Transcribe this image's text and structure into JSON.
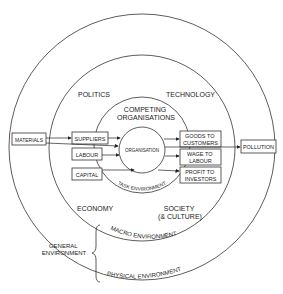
{
  "diagram": {
    "rings": {
      "general": "GENERAL\nENVIRONMENT",
      "general_lines": [
        "GENERAL",
        "ENVIRONMENT"
      ],
      "macro": "MACRO ENVIRONMENT",
      "physical": "PHYSICAL ENVIRONMENT",
      "task": "TASK ENVIRONMENT"
    },
    "macro_factors": {
      "politics": "POLITICS",
      "technology": "TECHNOLOGY",
      "economy": "ECONOMY",
      "society_lines": [
        "SOCIETY",
        "(& CULTURE)"
      ]
    },
    "competing_lines": [
      "COMPETING",
      "ORGANISATIONS"
    ],
    "centre": "ORGANISATION",
    "inputs": {
      "materials": "MATERIALS",
      "suppliers": "SUPPLIERS",
      "labour": "LABOUR",
      "capital": "CAPITAL"
    },
    "outputs": {
      "goods_lines": [
        "GOODS TO",
        "CUSTOMERS"
      ],
      "wage_lines": [
        "WAGE TO",
        "LABOUR"
      ],
      "profit_lines": [
        "PROFIT TO",
        "INVESTORS"
      ],
      "pollution": "POLLUTION"
    },
    "colors": {
      "line": "#333333",
      "text": "#222222",
      "background": "#ffffff"
    }
  }
}
